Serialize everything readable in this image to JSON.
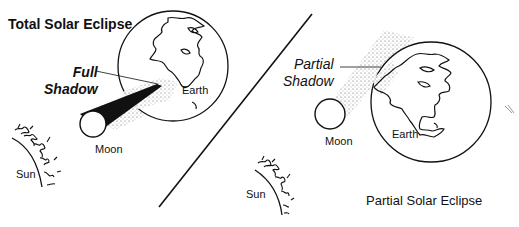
{
  "diagram": {
    "total_eclipse": {
      "title": "Total Solar Eclipse",
      "shadow_label_line1": "Full",
      "shadow_label_line2": "Shadow",
      "earth_label": "Earth",
      "moon_label": "Moon",
      "sun_label": "Sun"
    },
    "partial_eclipse": {
      "title": "Partial Solar Eclipse",
      "shadow_label_line1": "Partial",
      "shadow_label_line2": "Shadow",
      "earth_label": "Earth",
      "moon_label": "Moon",
      "sun_label": "Sun"
    },
    "colors": {
      "ink": "#111111",
      "background": "#ffffff",
      "stipple": "#555555"
    }
  }
}
